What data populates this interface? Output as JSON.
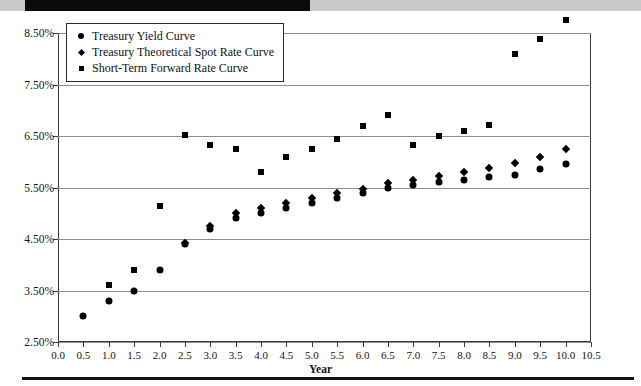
{
  "chart_data": {
    "type": "scatter",
    "title": "",
    "xlabel": "Year",
    "ylabel": "",
    "xlim": [
      0.0,
      10.5
    ],
    "ylim": [
      2.5,
      8.5
    ],
    "grid": true,
    "legend_position": "top-left",
    "x_ticks": [
      "0.0",
      "0.5",
      "1.0",
      "1.5",
      "2.0",
      "2.5",
      "3.0",
      "3.5",
      "4.0",
      "4.5",
      "5.0",
      "5.5",
      "6.0",
      "6.5",
      "7.0",
      "7.5",
      "8.0",
      "8.5",
      "9.0",
      "9.5",
      "10.0",
      "10.5"
    ],
    "x_tick_values": [
      0.0,
      0.5,
      1.0,
      1.5,
      2.0,
      2.5,
      3.0,
      3.5,
      4.0,
      4.5,
      5.0,
      5.5,
      6.0,
      6.5,
      7.0,
      7.5,
      8.0,
      8.5,
      9.0,
      9.5,
      10.0,
      10.5
    ],
    "y_ticks": [
      "2.50%",
      "3.50%",
      "4.50%",
      "5.50%",
      "6.50%",
      "7.50%",
      "8.50%"
    ],
    "y_tick_values": [
      2.5,
      3.5,
      4.5,
      5.5,
      6.5,
      7.5,
      8.5
    ],
    "series": [
      {
        "name": "Treasury Yield Curve",
        "marker": "circle",
        "color": "#000000",
        "x": [
          0.5,
          1.0,
          1.5,
          2.0,
          2.5,
          3.0,
          3.5,
          4.0,
          4.5,
          5.0,
          5.5,
          6.0,
          6.5,
          7.0,
          7.5,
          8.0,
          8.5,
          9.0,
          9.5,
          10.0
        ],
        "y": [
          3.0,
          3.3,
          3.5,
          3.9,
          4.4,
          4.7,
          4.9,
          5.0,
          5.1,
          5.2,
          5.3,
          5.4,
          5.5,
          5.55,
          5.6,
          5.65,
          5.7,
          5.75,
          5.85,
          5.95
        ]
      },
      {
        "name": "Treasury Theoretical Spot Rate Curve",
        "marker": "diamond",
        "color": "#000000",
        "x": [
          2.5,
          3.0,
          3.5,
          4.0,
          4.5,
          5.0,
          5.5,
          6.0,
          6.5,
          7.0,
          7.5,
          8.0,
          8.5,
          9.0,
          9.5,
          10.0
        ],
        "y": [
          4.42,
          4.75,
          5.0,
          5.1,
          5.2,
          5.3,
          5.4,
          5.48,
          5.58,
          5.65,
          5.72,
          5.8,
          5.88,
          5.98,
          6.1,
          6.25
        ]
      },
      {
        "name": "Short-Term Forward Rate Curve",
        "marker": "square",
        "color": "#000000",
        "x": [
          1.0,
          1.5,
          2.0,
          2.5,
          3.0,
          3.5,
          4.0,
          4.5,
          5.0,
          5.5,
          6.0,
          6.5,
          7.0,
          7.5,
          8.0,
          8.5,
          9.0,
          9.5,
          10.0
        ],
        "y": [
          3.6,
          3.9,
          5.15,
          6.52,
          6.32,
          6.25,
          5.8,
          6.1,
          6.25,
          6.45,
          6.7,
          6.9,
          6.32,
          6.5,
          6.6,
          6.72,
          8.1,
          8.38,
          8.75
        ]
      }
    ]
  }
}
